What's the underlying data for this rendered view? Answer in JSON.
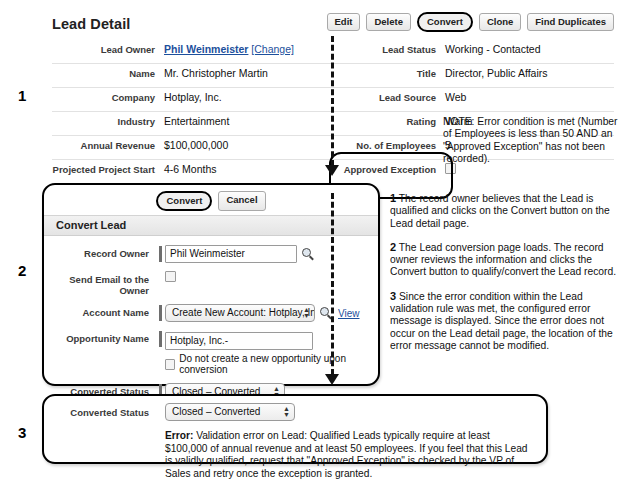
{
  "steps": {
    "one": "1",
    "two": "2",
    "three": "3"
  },
  "lead_detail": {
    "title": "Lead Detail",
    "buttons": [
      {
        "label": "Edit",
        "highlighted": false
      },
      {
        "label": "Delete",
        "highlighted": false
      },
      {
        "label": "Convert",
        "highlighted": true
      },
      {
        "label": "Clone",
        "highlighted": false
      },
      {
        "label": "Find Duplicates",
        "highlighted": false
      }
    ],
    "left_fields": [
      {
        "label": "Lead Owner",
        "value": "Phil Weinmeister",
        "link": "[Change]"
      },
      {
        "label": "Name",
        "value": "Mr. Christopher Martin"
      },
      {
        "label": "Company",
        "value": "Hotplay, Inc."
      },
      {
        "label": "Industry",
        "value": "Entertainment"
      },
      {
        "label": "Annual Revenue",
        "value": "$100,000,000"
      },
      {
        "label": "Projected Project Start",
        "value": "4-6 Months"
      }
    ],
    "right_fields": [
      {
        "label": "Lead Status",
        "value": "Working - Contacted"
      },
      {
        "label": "Title",
        "value": "Director, Public Affairs"
      },
      {
        "label": "Lead Source",
        "value": "Web"
      },
      {
        "label": "Rating",
        "value": "Warm"
      },
      {
        "label": "No. of Employees",
        "value": "5"
      },
      {
        "label": "Approved Exception",
        "value": "",
        "checkbox": true,
        "checked": false
      }
    ],
    "note": "NOTE: Error condition is met (Number of Employees is less than 50 AND an \"Approved Exception\" has not been recorded)."
  },
  "convert_panel": {
    "buttons": [
      {
        "label": "Convert",
        "highlighted": true
      },
      {
        "label": "Cancel",
        "highlighted": false
      }
    ],
    "section_title": "Convert Lead",
    "fields": {
      "record_owner_label": "Record Owner",
      "record_owner_value": "Phil Weinmeister",
      "send_email_label": "Send Email to the Owner",
      "account_name_label": "Account Name",
      "account_name_value": "Create New Account: Hotplay, Inc.",
      "account_view_link": "View",
      "opportunity_name_label": "Opportunity Name",
      "opportunity_name_value": "Hotplay, Inc.-",
      "no_opportunity_label": "Do not create a new opportunity upon conversion",
      "converted_status_label": "Converted Status",
      "converted_status_value": "Closed – Converted"
    },
    "icons": {
      "lookup": "search-icon"
    }
  },
  "error_panel": {
    "converted_status_label": "Converted Status",
    "converted_status_value": "Closed – Converted",
    "error_prefix": "Error:",
    "error_message": " Validation error on Lead: Qualified Leads typically require at least $100,000 of annual revenue and at least 50 employees. If you feel that this Lead is validly qualified, request that \"Approved Exception\" is checked by the VP of Sales and retry once the exception is granted."
  },
  "explanations": [
    {
      "num": "1",
      "text": " The record owner believes that the Lead is qualified and clicks on the Convert button on the Lead detail page."
    },
    {
      "num": "2",
      "text": " The Lead conversion page loads. The record owner reviews the information and clicks the Convert button to qualify/convert the Lead record."
    },
    {
      "num": "3",
      "text": " Since the error condition within the Lead validation rule was met, the configured error message is displayed. Since the error does not occur on the Lead detail page, the location of the error message cannot be modified."
    }
  ]
}
